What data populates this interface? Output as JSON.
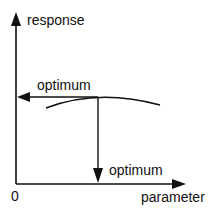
{
  "diagram": {
    "y_axis_label": "response",
    "x_axis_label": "parameter",
    "origin_label": "0",
    "optimum_response_label": "optimum",
    "optimum_parameter_label": "optimum"
  }
}
